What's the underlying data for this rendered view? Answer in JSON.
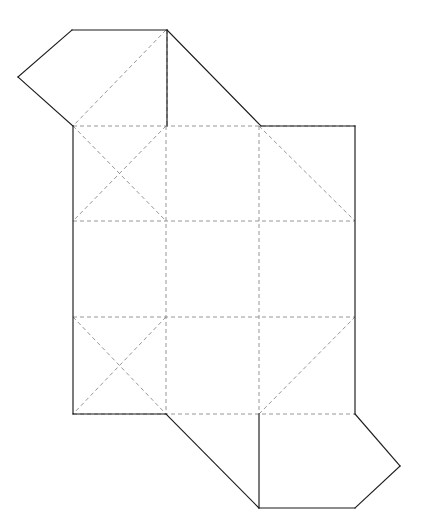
{
  "document": {
    "title": "Box Net Template",
    "kind": "papercraft-net-diagram",
    "width": 422,
    "height": 532,
    "background_color": "#ffffff"
  },
  "style": {
    "cut_line_color": "#1a1a1a",
    "cut_line_width": 1.15,
    "fold_line_color": "#8a8a8a",
    "fold_line_width": 0.9,
    "fold_dash_pattern": "4 3"
  },
  "legend": {
    "cut_line_label": "solid line - cut edge",
    "fold_line_label": "dashed line - fold crease"
  },
  "geometry": {
    "grid_x": [
      73,
      166,
      259,
      355
    ],
    "grid_y": [
      126,
      221,
      317,
      414
    ],
    "top_flap_apex_left": [
      18,
      77
    ],
    "top_flap_top_left": [
      72,
      30
    ],
    "top_flap_top_right": [
      167,
      30
    ],
    "bottom_flap_apex_right": [
      400,
      466
    ],
    "bottom_flap_bottom_left": [
      259,
      508
    ],
    "bottom_flap_bottom_right": [
      355,
      508
    ]
  },
  "paths": {
    "outline": "M 73,126 L 18,77 L 72,30 L 167,30 L 261,126 L 355,126 L 355,414 L 400,466 L 355,508 L 259,508 L 166,414 L 73,414 Z",
    "cut_segments": [
      "M 73,126 L 18,77",
      "M 18,77 L 72,30",
      "M 72,30 L 167,30",
      "M 167,30 L 261,126",
      "M 167,30 L 167,126",
      "M 261,126 L 355,126",
      "M 355,126 L 355,414",
      "M 355,414 L 400,466",
      "M 400,466 L 355,508",
      "M 355,508 L 259,508",
      "M 259,508 L 166,414",
      "M 259,414 L 259,508",
      "M 166,414 L 73,414",
      "M 73,414 L 73,126"
    ],
    "fold_segments": [
      "M 73,126 L 355,126",
      "M 73,221 L 355,221",
      "M 73,317 L 355,317",
      "M 73,414 L 355,414",
      "M 166,126 L 166,414",
      "M 259,126 L 259,414",
      "M 73,126 L 166,221",
      "M 166,126 L 73,221",
      "M 259,126 L 355,221",
      "M 73,317 L 166,414",
      "M 166,317 L 73,414",
      "M 259,414 L 355,317",
      "M 166,30 L 73,126",
      "M 167,30 L 167,126",
      "M 259,508 L 355,414"
    ]
  },
  "panels": [
    {
      "id": "panel-top-flap",
      "label": "top closure flap",
      "type": "flap"
    },
    {
      "id": "panel-left-upper",
      "label": "left upper side panel",
      "type": "side"
    },
    {
      "id": "panel-center-upper",
      "label": "center upper panel",
      "type": "face"
    },
    {
      "id": "panel-right-upper",
      "label": "right upper side panel",
      "type": "side"
    },
    {
      "id": "panel-left-mid",
      "label": "left middle panel",
      "type": "side"
    },
    {
      "id": "panel-center-mid",
      "label": "center base panel",
      "type": "base"
    },
    {
      "id": "panel-right-mid",
      "label": "right middle panel",
      "type": "side"
    },
    {
      "id": "panel-left-lower",
      "label": "left lower side panel",
      "type": "side"
    },
    {
      "id": "panel-center-lower",
      "label": "center lower panel",
      "type": "face"
    },
    {
      "id": "panel-right-lower",
      "label": "right lower side panel",
      "type": "side"
    },
    {
      "id": "panel-bottom-flap",
      "label": "bottom closure flap",
      "type": "flap"
    }
  ]
}
